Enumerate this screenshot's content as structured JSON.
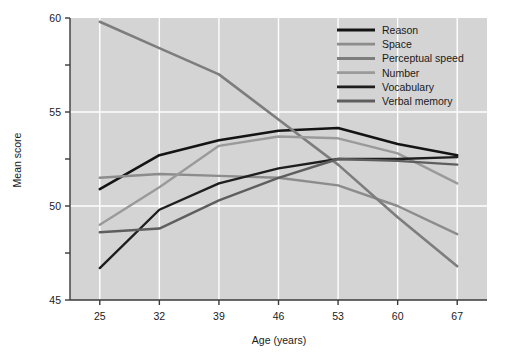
{
  "chart_data": {
    "type": "line",
    "title": "",
    "xlabel": "Age (years)",
    "ylabel": "Mean score",
    "x": [
      25,
      32,
      39,
      46,
      53,
      60,
      67
    ],
    "categories": [
      "25",
      "32",
      "39",
      "46",
      "53",
      "60",
      "67"
    ],
    "xlim": [
      21.5,
      70.5
    ],
    "ylim": [
      45,
      60
    ],
    "xticks": [
      "25",
      "32",
      "39",
      "46",
      "53",
      "60",
      "67"
    ],
    "yticks": [
      "45",
      "50",
      "55",
      "60"
    ],
    "yminorticks": [
      "47.5",
      "52.5",
      "57.5"
    ],
    "grid": true,
    "grid_color": "#ffffff",
    "plot_background": "#d4d4d4",
    "legend_position": "top-right",
    "series": [
      {
        "name": "Reason",
        "color": "#141414",
        "width": 2.6,
        "values": [
          50.9,
          52.7,
          53.5,
          54.0,
          54.15,
          53.3,
          52.7
        ]
      },
      {
        "name": "Space",
        "color": "#8c8c8c",
        "width": 2.4,
        "values": [
          51.5,
          51.7,
          51.6,
          51.5,
          51.1,
          50.0,
          48.5
        ]
      },
      {
        "name": "Perceptual speed",
        "color": "#7d7d7d",
        "width": 2.6,
        "values": [
          59.8,
          58.4,
          57.0,
          54.6,
          52.2,
          49.4,
          46.8
        ]
      },
      {
        "name": "Number",
        "color": "#9a9a9a",
        "width": 2.4,
        "values": [
          49.0,
          51.0,
          53.2,
          53.7,
          53.6,
          52.8,
          51.2
        ]
      },
      {
        "name": "Vocabulary",
        "color": "#1e1e1e",
        "width": 2.4,
        "values": [
          46.7,
          49.8,
          51.2,
          52.0,
          52.5,
          52.5,
          52.6
        ]
      },
      {
        "name": "Verbal memory",
        "color": "#5e5e5e",
        "width": 2.4,
        "values": [
          48.6,
          48.8,
          50.3,
          51.5,
          52.5,
          52.4,
          52.2
        ]
      }
    ]
  },
  "axes": {
    "y_title": "Mean score",
    "x_title": "Age (years)"
  },
  "legend": {
    "items": [
      {
        "label": "Reason"
      },
      {
        "label": "Space"
      },
      {
        "label": "Perceptual speed"
      },
      {
        "label": "Number"
      },
      {
        "label": "Vocabulary"
      },
      {
        "label": "Verbal memory"
      }
    ]
  }
}
